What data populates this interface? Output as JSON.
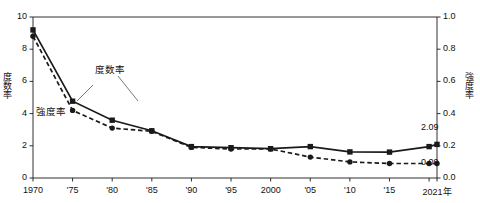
{
  "chart_data": {
    "type": "line",
    "title": "",
    "xlabel": "",
    "ylabel": "度数率",
    "y2label": "強度率",
    "grid": false,
    "legend_position": "inline-annotation",
    "x": [
      1970,
      1975,
      1980,
      1985,
      1990,
      1995,
      2000,
      2005,
      2010,
      2015,
      2020,
      2021
    ],
    "xtick_labels": [
      "1970",
      "'75",
      "'80",
      "'85",
      "'90",
      "'95",
      "2000",
      "'05",
      "'10",
      "'15",
      "2021年"
    ],
    "xtick_values": [
      1970,
      1975,
      1980,
      1985,
      1990,
      1995,
      2000,
      2005,
      2010,
      2015,
      2021
    ],
    "ylim": [
      0,
      10
    ],
    "ytick_labels": [
      "0",
      "2",
      "4",
      "6",
      "8",
      "10"
    ],
    "ytick_values": [
      0,
      2,
      4,
      6,
      8,
      10
    ],
    "y2lim": [
      0,
      1.0
    ],
    "y2tick_labels": [
      "0.0",
      "0.2",
      "0.4",
      "0.6",
      "0.8",
      "1.0"
    ],
    "y2tick_values": [
      0.0,
      0.2,
      0.4,
      0.6,
      0.8,
      1.0
    ],
    "series": [
      {
        "name": "度数率",
        "axis": "left",
        "marker": "square",
        "line_style": "solid",
        "color": "#1a1a1a",
        "values": [
          9.2,
          4.77,
          3.59,
          2.93,
          1.95,
          1.88,
          1.82,
          1.95,
          1.62,
          1.61,
          1.95,
          2.09
        ]
      },
      {
        "name": "強度率",
        "axis": "right",
        "marker": "circle",
        "line_style": "dashed",
        "color": "#1a1a1a",
        "values": [
          0.88,
          0.42,
          0.31,
          0.29,
          0.19,
          0.18,
          0.18,
          0.13,
          0.1,
          0.09,
          0.09,
          0.09
        ]
      }
    ],
    "annotations": [
      {
        "text": "度数率",
        "target_series": "度数率"
      },
      {
        "text": "強度率",
        "target_series": "強度率"
      }
    ],
    "value_labels": [
      {
        "text": "2.09",
        "series": "度数率",
        "x": 2021,
        "value": 2.09
      },
      {
        "text": "0.09",
        "series": "強度率",
        "x": 2021,
        "value": 0.09
      }
    ]
  }
}
